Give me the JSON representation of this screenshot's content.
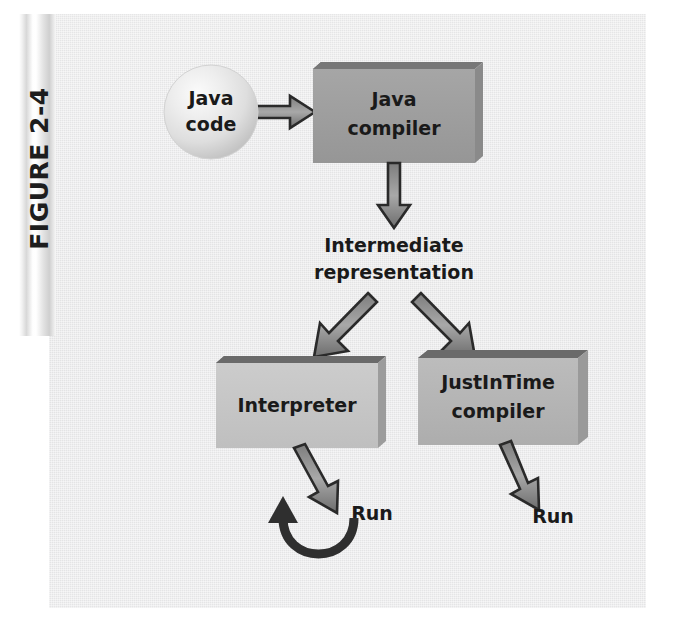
{
  "figure": {
    "label": "FIGURE 2-4",
    "background_color": "#eaeaeb",
    "plate_color": "#ececed"
  },
  "diagram": {
    "type": "flowchart",
    "title": "FIGURE 2-4",
    "nodes": [
      {
        "id": "java-code",
        "label_lines": [
          "Java",
          "code"
        ],
        "shape": "sphere",
        "fill": "#e3e3e3",
        "text_color": "#1a1a1a"
      },
      {
        "id": "java-compiler",
        "label_lines": [
          "Java",
          "compiler"
        ],
        "shape": "box-3d",
        "fill": "#9d9d9d",
        "text_color": "#1a1a1a"
      },
      {
        "id": "intermediate-representation",
        "label_lines": [
          "Intermediate",
          "representation"
        ],
        "shape": "text",
        "fill": "none",
        "text_color": "#1a1a1a"
      },
      {
        "id": "interpreter",
        "label_lines": [
          "Interpreter"
        ],
        "shape": "box-3d",
        "fill": "#c6c6c6",
        "text_color": "#1a1a1a"
      },
      {
        "id": "justintime-compiler",
        "label_lines": [
          "JustInTime",
          "compiler"
        ],
        "shape": "box-3d",
        "fill": "#b5b5b5",
        "text_color": "#1a1a1a"
      },
      {
        "id": "run-left",
        "label_lines": [
          "Run"
        ],
        "shape": "text",
        "fill": "none",
        "text_color": "#1a1a1a"
      },
      {
        "id": "run-right",
        "label_lines": [
          "Run"
        ],
        "shape": "text",
        "fill": "none",
        "text_color": "#1a1a1a"
      }
    ],
    "edges": [
      {
        "id": "e1",
        "from": "java-code",
        "to": "java-compiler",
        "style": "hollow-block-arrow",
        "direction": "right"
      },
      {
        "id": "e2",
        "from": "java-compiler",
        "to": "intermediate-representation",
        "style": "hollow-block-arrow",
        "direction": "down"
      },
      {
        "id": "e3",
        "from": "intermediate-representation",
        "to": "interpreter",
        "style": "hollow-block-arrow",
        "direction": "down-left"
      },
      {
        "id": "e4",
        "from": "intermediate-representation",
        "to": "justintime-compiler",
        "style": "hollow-block-arrow",
        "direction": "down-right"
      },
      {
        "id": "e5",
        "from": "interpreter",
        "to": "run-left",
        "style": "hollow-block-arrow",
        "direction": "down-right"
      },
      {
        "id": "e6",
        "from": "justintime-compiler",
        "to": "run-right",
        "style": "hollow-block-arrow",
        "direction": "down-right"
      },
      {
        "id": "e7",
        "from": "run-left",
        "to": "interpreter",
        "style": "solid-curved-arrow",
        "direction": "loop-back"
      }
    ]
  }
}
